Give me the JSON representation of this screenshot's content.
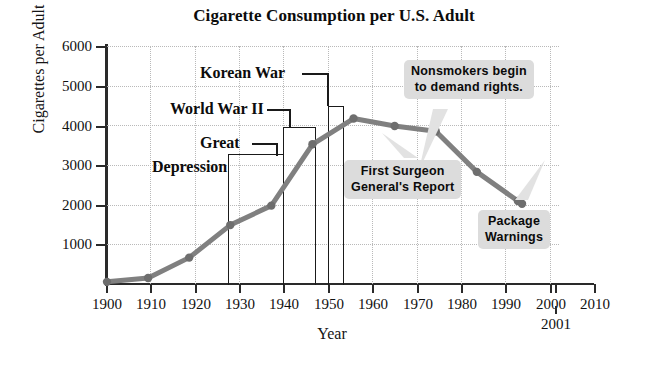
{
  "chart_data": {
    "type": "line",
    "title": "Cigarette Consumption per U.S. Adult",
    "xlabel": "Year",
    "ylabel": "Cigarettes per Adult",
    "xlim": [
      1900,
      2010
    ],
    "ylim": [
      0,
      6000
    ],
    "grid": true,
    "legend": "none",
    "x": [
      1900,
      1910,
      1920,
      1930,
      1940,
      1950,
      1960,
      1970,
      1980,
      1990,
      2000,
      2001
    ],
    "values": [
      54,
      151,
      665,
      1485,
      1976,
      3522,
      4171,
      3985,
      3850,
      2827,
      2092,
      2025
    ],
    "series": [
      {
        "name": "Cigarettes per Adult",
        "values": [
          54,
          151,
          665,
          1485,
          1976,
          3522,
          4171,
          3985,
          3850,
          2827,
          2092,
          2025
        ]
      }
    ],
    "xticks": [
      "1900",
      "1910",
      "1920",
      "1930",
      "1940",
      "1950",
      "1960",
      "1970",
      "1980",
      "1990",
      "2000",
      "2010"
    ],
    "xticks_extra": [
      "2001"
    ],
    "yticks": [
      "1000",
      "2000",
      "3000",
      "4000",
      "5000",
      "6000"
    ],
    "line_color": "#808080",
    "marker_color": "#6e6e6e",
    "annotation_box_color": "#dcdcdc",
    "event_brackets": [
      {
        "label": "Great Depression",
        "start": 1929,
        "end": 1939,
        "top_value": 3270
      },
      {
        "label": "World War II",
        "start": 1939,
        "end": 1945,
        "top_value": 3950
      },
      {
        "label": "Korean War",
        "start": 1950,
        "end": 1953,
        "top_value": 4470
      }
    ],
    "annotations": [
      {
        "id": "nonsmokers",
        "lines": [
          "Nonsmokers begin",
          "to demand rights."
        ],
        "points_to_year": 1970
      },
      {
        "id": "surgeon-general",
        "lines": [
          "First Surgeon",
          "General's Report"
        ],
        "points_to_year": 1964
      },
      {
        "id": "package-warnings",
        "lines": [
          "Package",
          "Warnings"
        ],
        "points_to_year": 1984
      }
    ]
  },
  "labels": {
    "great": "Great",
    "depression": "Depression",
    "world_war_ii": "World War II",
    "korean_war": "Korean War"
  },
  "annotations": {
    "nonsmokers_l1": "Nonsmokers begin",
    "nonsmokers_l2": "to demand rights.",
    "surgeon_l1": "First Surgeon",
    "surgeon_l2": "General's Report",
    "package_l1": "Package",
    "package_l2": "Warnings"
  },
  "ticks": {
    "y": [
      "6000",
      "5000",
      "4000",
      "3000",
      "2000",
      "1000"
    ],
    "x": [
      "1900",
      "1910",
      "1920",
      "1930",
      "1940",
      "1950",
      "1960",
      "1970",
      "1980",
      "1990",
      "2000",
      "2010"
    ],
    "x_extra": "2001"
  }
}
